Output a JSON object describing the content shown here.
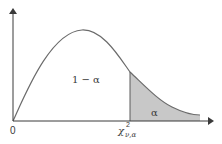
{
  "figure": {
    "type": "chi-square distribution diagram",
    "labels": {
      "origin": "0",
      "acceptance_region": "1 − α",
      "rejection_region": "α",
      "critical_value_symbol": "χ",
      "critical_value_superscript": "2",
      "critical_value_subscript": "ν,α"
    },
    "colors": {
      "background": "#ffffff",
      "axis": "#3a3a3a",
      "curve": "#6b6b6b",
      "shaded_region": "#c8c8c8",
      "text": "#3a3a3a"
    }
  }
}
